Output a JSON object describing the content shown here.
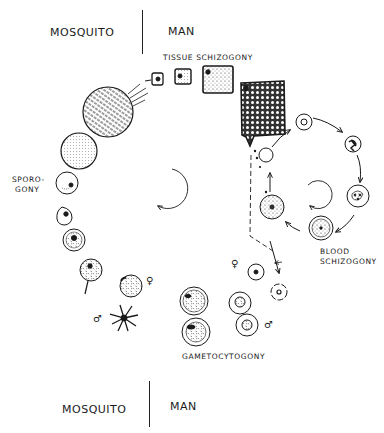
{
  "header": {
    "left_host": "MOSQUITO",
    "right_host": "MAN"
  },
  "footer": {
    "left_host": "MOSQUITO",
    "right_host": "MAN"
  },
  "stages": {
    "tissue_schizogony": "TISSUE  SCHIZOGONY",
    "sporogony_line1": "SPORO-",
    "sporogony_line2": "GONY",
    "blood_schizogony_line1": "BLOOD",
    "blood_schizogony_line2": "SCHIZOGONY",
    "gametocytogony": "GAMETOCYTOGONY"
  },
  "symbols": {
    "female": "♀",
    "male": "♂"
  },
  "colors": {
    "ink": "#1a1a1a",
    "paper": "#ffffff"
  }
}
